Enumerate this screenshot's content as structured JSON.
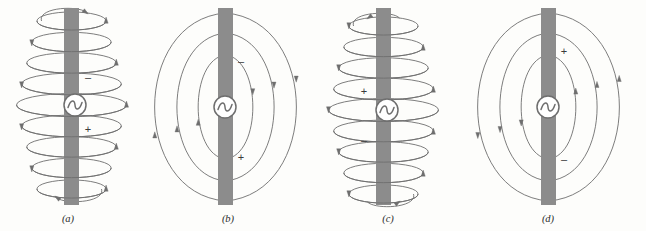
{
  "figure": {
    "title": "",
    "background_color": "#fdfdfb",
    "antenna_bar_color": "#8c8c8c",
    "line_color": "#6e6e6e",
    "text_color": "#2b2b2b"
  },
  "panels": [
    {
      "id": "a",
      "caption": "(a)",
      "caption_x": 68,
      "caption_y": 222,
      "field_style": "helical-loops",
      "loop_count": 9,
      "source_symbol": "ac-source",
      "source_x": 75,
      "source_y": 105,
      "bar_x": 64,
      "bar_width": 15,
      "bar_top": 8,
      "bar_bottom": 205,
      "signs": [
        {
          "label": "–",
          "x": 88,
          "y": 78
        },
        {
          "label": "+",
          "x": 88,
          "y": 130
        }
      ]
    },
    {
      "id": "b",
      "caption": "(b)",
      "caption_x": 228,
      "caption_y": 222,
      "field_style": "concentric-loops",
      "loop_count": 3,
      "source_symbol": "ac-source",
      "source_x": 225,
      "source_y": 107,
      "bar_x": 218,
      "bar_width": 15,
      "bar_top": 8,
      "bar_bottom": 205,
      "signs": [
        {
          "label": "–",
          "x": 241,
          "y": 62
        },
        {
          "label": "+",
          "x": 241,
          "y": 158
        }
      ]
    },
    {
      "id": "c",
      "caption": "(c)",
      "caption_x": 388,
      "caption_y": 222,
      "field_style": "helical-loops",
      "loop_count": 9,
      "source_symbol": "ac-source",
      "source_x": 387,
      "source_y": 110,
      "bar_x": 376,
      "bar_width": 15,
      "bar_top": 8,
      "bar_bottom": 205,
      "signs": [
        {
          "label": "+",
          "x": 364,
          "y": 92
        },
        {
          "label": "–",
          "x": 364,
          "y": 141
        }
      ]
    },
    {
      "id": "d",
      "caption": "(d)",
      "caption_x": 548,
      "caption_y": 222,
      "field_style": "concentric-loops",
      "loop_count": 3,
      "source_symbol": "ac-source",
      "source_x": 548,
      "source_y": 107,
      "bar_x": 541,
      "bar_width": 15,
      "bar_top": 8,
      "bar_bottom": 205,
      "signs": [
        {
          "label": "+",
          "x": 564,
          "y": 52
        },
        {
          "label": "–",
          "x": 564,
          "y": 160
        }
      ]
    }
  ],
  "chart_data": {
    "type": "diagram",
    "panel_labels": [
      "(a)",
      "(b)",
      "(c)",
      "(d)"
    ],
    "elements": {
      "antenna": "vertical gray bar",
      "source": "AC source (circle enclosing a sine wave)",
      "field_lines": "closed loops with directional arrowheads",
      "polarity_markers": [
        "+",
        "–"
      ]
    }
  }
}
